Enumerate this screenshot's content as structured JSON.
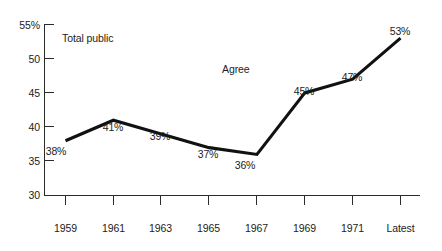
{
  "chart_data": {
    "type": "line",
    "title": "",
    "xlabel": "",
    "ylabel": "",
    "categories": [
      "1959",
      "1961",
      "1963",
      "1965",
      "1967",
      "1969",
      "1971",
      "Latest"
    ],
    "values": [
      38,
      41,
      39,
      37,
      36,
      45,
      47,
      53
    ],
    "point_labels": [
      "38%",
      "41%",
      "39%",
      "37%",
      "36%",
      "45%",
      "47%",
      "53%"
    ],
    "ylim": [
      30,
      55
    ],
    "yticks": [
      55,
      50,
      45,
      40,
      35,
      30
    ],
    "ytick_labels": [
      "55%",
      "50",
      "45",
      "40",
      "35",
      "30"
    ],
    "grid": false,
    "legend": "none",
    "series": [
      {
        "name": "Total public",
        "values": [
          38,
          41,
          39,
          37,
          36,
          45,
          47,
          53
        ],
        "color": "#111111"
      }
    ],
    "annotations": [
      {
        "text": "Total public",
        "x_px": 62,
        "y_px": 32
      },
      {
        "text": "Agree",
        "x_px": 222,
        "y_px": 63
      }
    ],
    "line_color": "#111111",
    "axis_color": "#2b2b2b",
    "background_color": "#ffffff"
  }
}
